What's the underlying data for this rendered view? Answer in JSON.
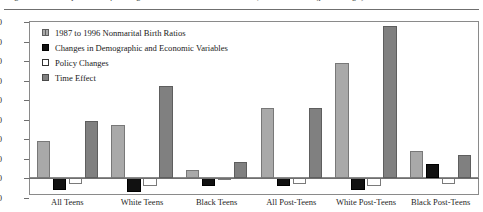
{
  "figure": {
    "caption": "(percentage)",
    "caption_full": "Figure 2.  Decomposition of Changes in Nonmarital Birth Ratios, 1987 to 1996  (percentage)"
  },
  "legend": {
    "position": "top-left-inside",
    "items": [
      {
        "label": "1987 to 1996 Nonmarital Birth Ratios",
        "swatch": "hatched-gray-swatch",
        "color": "#a9a9a9"
      },
      {
        "label": "Changes in Demographic and Economic Variables",
        "swatch": "solid-black-swatch",
        "color": "#111111"
      },
      {
        "label": "Policy Changes",
        "swatch": "open-white-swatch",
        "color": "#ffffff"
      },
      {
        "label": "Time Effect",
        "swatch": "solid-gray-swatch",
        "color": "#808080"
      }
    ]
  },
  "axes": {
    "y_ticks": [
      "80",
      "70",
      "60",
      "50",
      "40",
      "30",
      "20",
      "10",
      "0",
      "-10"
    ],
    "x_categories": [
      "All Teens",
      "White Teens",
      "Black Teens",
      "All Post-Teens",
      "White Post-Teens",
      "Black Post-Teens"
    ]
  },
  "chart_data": {
    "type": "bar",
    "title": "",
    "subtitle": "",
    "xlabel": "",
    "ylabel": "",
    "ylim": [
      -10,
      80
    ],
    "ytick_step": 10,
    "grid": false,
    "legend_position": "top-left-inside",
    "categories": [
      "All Teens",
      "White Teens",
      "Black Teens",
      "All Post-Teens",
      "White Post-Teens",
      "Black Post-Teens"
    ],
    "series": [
      {
        "name": "1987 to 1996 Nonmarital Birth Ratios",
        "color": "#a9a9a9",
        "values": [
          19,
          27,
          4,
          36,
          59,
          14
        ]
      },
      {
        "name": "Changes in Demographic and Economic Variables",
        "color": "#111111",
        "values": [
          -6,
          -7,
          -4,
          -4,
          -6,
          7
        ]
      },
      {
        "name": "Policy Changes",
        "color": "#ffffff",
        "values": [
          -3,
          -4,
          -1,
          -3,
          -4,
          -3
        ]
      },
      {
        "name": "Time Effect",
        "color": "#808080",
        "values": [
          29,
          47,
          8,
          36,
          78,
          12
        ]
      }
    ]
  }
}
